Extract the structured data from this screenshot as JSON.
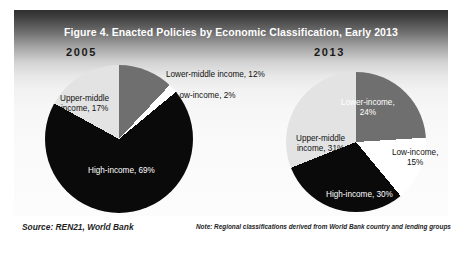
{
  "figure": {
    "title": "Figure 4. Enacted Policies by Economic Classification, Early 2013",
    "source": "Source: REN21, World Bank",
    "note": "Note: Regional classifications derived from World Bank country and lending groups"
  },
  "colors": {
    "high_income": "#0a0a0a",
    "upper_middle_income": "#e3e3e3",
    "lower_middle_income": "#6f6f6f",
    "lower_income": "#6f6f6f",
    "low_income": "#ffffff",
    "title_band": "#2f2f2f",
    "title_text": "#ffffff"
  },
  "panels": {
    "left": {
      "year": "2005"
    },
    "right": {
      "year": "2013"
    }
  },
  "labels": {
    "y2005": {
      "upper_middle": "Upper-middle\nincome, 17%",
      "upper_middle_l1": "Upper-middle",
      "upper_middle_l2": "income, 17%",
      "lower_middle": "Lower-middle income, 12%",
      "low": "Low-income, 2%",
      "high": "High-income, 69%"
    },
    "y2013": {
      "lower_l1": "Lower-income,",
      "lower_l2": "24%",
      "upper_middle_l1": "Upper-middle",
      "upper_middle_l2": "income, 31%",
      "low_l1": "Low-income,",
      "low_l2": "15%",
      "high": "High-income, 30%"
    }
  },
  "chart_data": [
    {
      "type": "pie",
      "title": "2005",
      "categories": [
        "Lower-middle income",
        "Low-income",
        "High-income",
        "Upper-middle income"
      ],
      "values": [
        12,
        2,
        69,
        17
      ],
      "labels": [
        "Lower-middle income, 12%",
        "Low-income, 2%",
        "High-income, 69%",
        "Upper-middle income, 17%"
      ],
      "colors": [
        "#6f6f6f",
        "#ffffff",
        "#0a0a0a",
        "#e3e3e3"
      ],
      "units": "percent",
      "start_angle_deg": 0,
      "direction": "clockwise",
      "legend": "none"
    },
    {
      "type": "pie",
      "title": "2013",
      "categories": [
        "Lower-income",
        "Low-income",
        "High-income",
        "Upper-middle income"
      ],
      "values": [
        24,
        15,
        30,
        31
      ],
      "labels": [
        "Lower-income, 24%",
        "Low-income, 15%",
        "High-income, 30%",
        "Upper-middle income, 31%"
      ],
      "colors": [
        "#6f6f6f",
        "#ffffff",
        "#0a0a0a",
        "#e3e3e3"
      ],
      "units": "percent",
      "start_angle_deg": 0,
      "direction": "clockwise",
      "legend": "none"
    }
  ]
}
